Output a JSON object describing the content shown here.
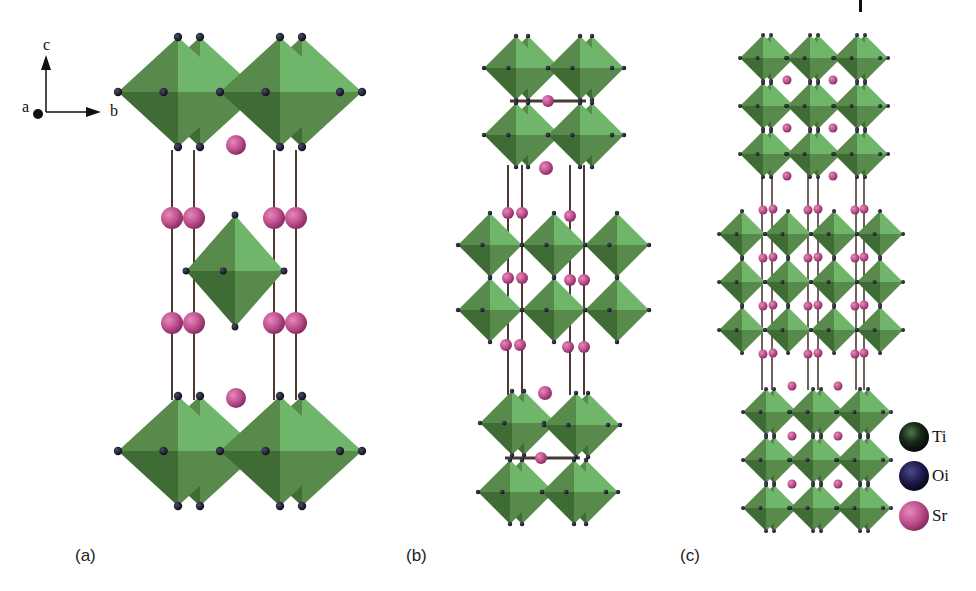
{
  "figure": {
    "panels": [
      {
        "id": "a",
        "label": "(a)",
        "description": "Sr2TiO4 (n=1 Ruddlesden-Popper)"
      },
      {
        "id": "b",
        "label": "(b)",
        "description": "Sr3Ti2O7 (n=2 Ruddlesden-Popper)"
      },
      {
        "id": "c",
        "label": "(c)",
        "description": "Sr4Ti3O10 (n=3 Ruddlesden-Popper)"
      }
    ],
    "axes": {
      "c": "c",
      "a": "a",
      "b": "b"
    },
    "legend": [
      {
        "symbol": "Ti",
        "label": "Ti",
        "color": "#1a2a1a"
      },
      {
        "symbol": "Oi",
        "label": "Oi",
        "color": "#1c1a4a"
      },
      {
        "symbol": "Sr",
        "label": "Sr",
        "color": "#c0508f"
      }
    ],
    "colors": {
      "octahedron_light": "#6fb66a",
      "octahedron_dark": "#3f6b35",
      "octahedron_mid": "#578a4b",
      "oxygen": "#1c1c2e",
      "strontium": "#c0508f",
      "bond": "#4a3a30"
    }
  }
}
